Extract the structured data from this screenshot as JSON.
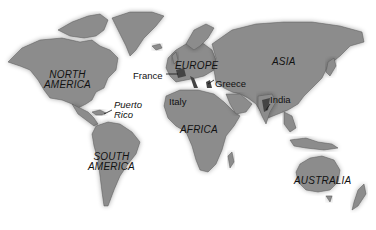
{
  "map": {
    "land_color": "#8c8c8c",
    "background_color": "#ffffff",
    "continents": [
      {
        "label_line1": "NORTH",
        "label_line2": "AMERICA"
      },
      {
        "label_line1": "SOUTH",
        "label_line2": "AMERICA"
      },
      {
        "label": "EUROPE"
      },
      {
        "label": "ASIA"
      },
      {
        "label": "AFRICA"
      },
      {
        "label": "AUSTRALIA"
      }
    ],
    "places": [
      {
        "label": "France"
      },
      {
        "label": "Italy"
      },
      {
        "label": "Greece"
      },
      {
        "label": "India"
      },
      {
        "label_line1": "Puerto",
        "label_line2": "Rico"
      }
    ]
  }
}
